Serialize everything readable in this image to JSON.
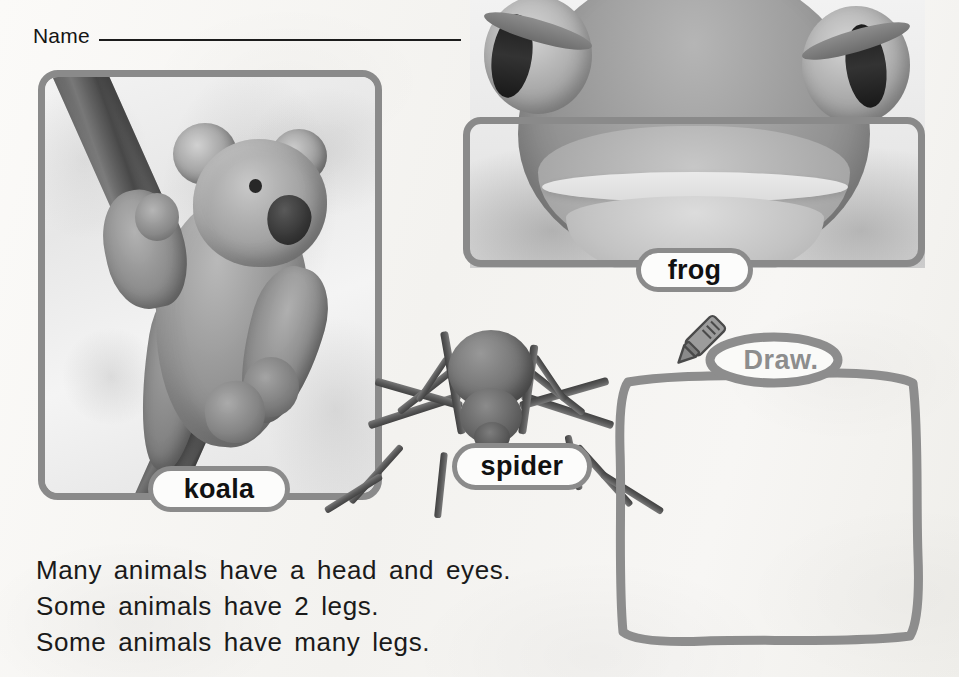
{
  "worksheet": {
    "name_field": {
      "label": "Name",
      "value": ""
    },
    "photos": [
      {
        "id": "koala",
        "label": "koala",
        "alt": "koala clinging to a tree branch",
        "framed": true
      },
      {
        "id": "frog",
        "label": "frog",
        "alt": "close-up of a tree frog face with large eyes",
        "framed": true
      },
      {
        "id": "spider",
        "label": "spider",
        "alt": "spider with eight long legs",
        "framed": false
      }
    ],
    "sentences": [
      "Many animals have a head and eyes.",
      "Some animals have 2 legs.",
      "Some animals have many legs."
    ],
    "draw_activity": {
      "badge_label": "Draw.",
      "icon": "crayon-icon",
      "box_contents": ""
    },
    "colors": {
      "page_background": "#f6f5f3",
      "frame_border": "#8a8a8a",
      "label_border": "#8b8b8b",
      "label_fill": "#fcfcfb",
      "text": "#1a1a1a",
      "draw_outline": "#8d8d8d",
      "rule_line": "#1c1c1c"
    }
  }
}
